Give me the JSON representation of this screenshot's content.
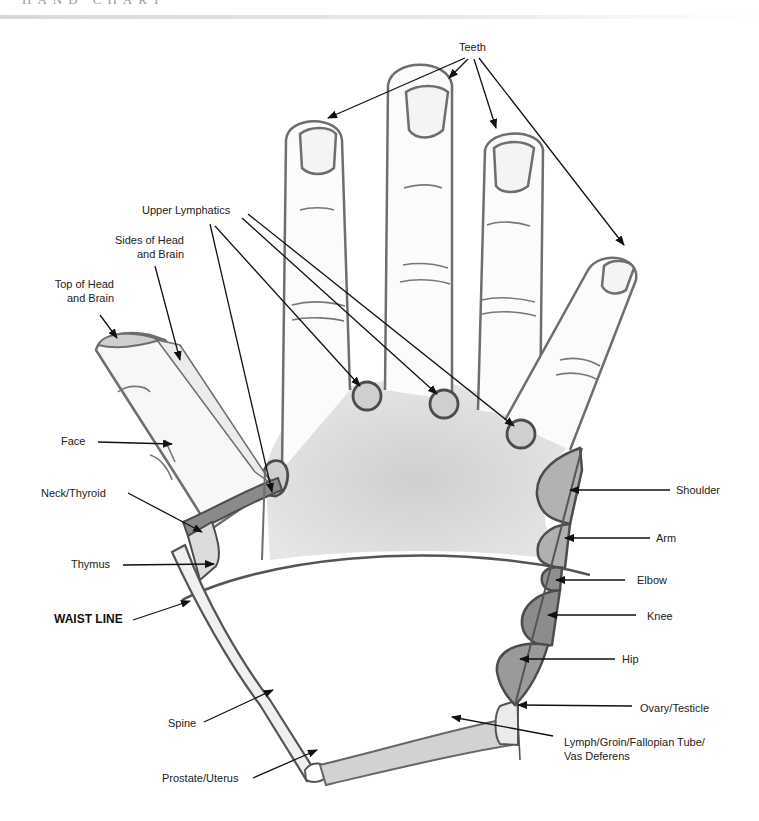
{
  "header": {
    "title": "HAND CHART"
  },
  "colors": {
    "outline": "#6e6e6e",
    "light_fill": "#e3e3e3",
    "mid_fill": "#b5b5b5",
    "dark_fill": "#8c8c8c",
    "arrow": "#111111"
  },
  "labels": {
    "teeth": "Teeth",
    "upper_lymphatics": "Upper Lymphatics",
    "sides_head_1": "Sides of Head",
    "sides_head_2": "and Brain",
    "top_head_1": "Top of Head",
    "top_head_2": "and Brain",
    "face": "Face",
    "neck_thyroid": "Neck/Thyroid",
    "thymus": "Thymus",
    "waist_line": "WAIST LINE",
    "spine": "Spine",
    "prostate_uterus": "Prostate/Uterus",
    "shoulder": "Shoulder",
    "arm": "Arm",
    "elbow": "Elbow",
    "knee": "Knee",
    "hip": "Hip",
    "ovary_testicle": "Ovary/Testicle",
    "lymph_1": "Lymph/Groin/Fallopian Tube/",
    "lymph_2": "Vas Deferens"
  }
}
